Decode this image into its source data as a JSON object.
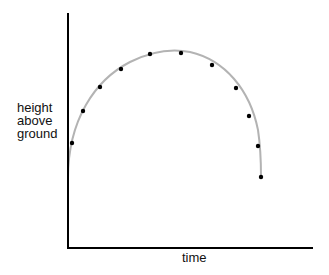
{
  "chart_data": {
    "type": "scatter",
    "title": "",
    "xlabel": "time",
    "ylabel": "height above ground",
    "ylabel_lines": [
      "height",
      "above",
      "ground"
    ],
    "grid": false,
    "legend": null,
    "ticks": "none",
    "curve": {
      "description": "smooth gray trajectory arc",
      "color": "#b3b3b3"
    },
    "points_color": "#000000",
    "points_px": [
      {
        "x": 72,
        "y": 143
      },
      {
        "x": 83,
        "y": 111
      },
      {
        "x": 100,
        "y": 87
      },
      {
        "x": 121,
        "y": 69
      },
      {
        "x": 150,
        "y": 54
      },
      {
        "x": 181,
        "y": 53
      },
      {
        "x": 212,
        "y": 65
      },
      {
        "x": 236,
        "y": 88
      },
      {
        "x": 249,
        "y": 116
      },
      {
        "x": 258,
        "y": 146
      },
      {
        "x": 261,
        "y": 177
      }
    ],
    "points_normalized": {
      "x": [
        0.02,
        0.06,
        0.13,
        0.22,
        0.34,
        0.46,
        0.59,
        0.69,
        0.74,
        0.78,
        0.79
      ],
      "y": [
        0.45,
        0.58,
        0.69,
        0.76,
        0.83,
        0.83,
        0.78,
        0.68,
        0.56,
        0.44,
        0.3
      ]
    }
  }
}
